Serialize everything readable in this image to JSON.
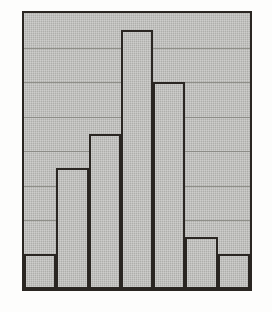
{
  "figure": {
    "title": "",
    "background_color": "#fdfdfc"
  },
  "plot": {
    "frame_color": "#2a2622",
    "fill_color": "#b5b5b2",
    "gridline_color": "#85857f",
    "gridline_count": 9
  },
  "chart_data": {
    "type": "bar",
    "title": "",
    "subtitle": "",
    "xlabel": "",
    "ylabel": "",
    "categories": [
      "1",
      "2",
      "3",
      "4",
      "5",
      "6",
      "7"
    ],
    "values": [
      1,
      3.5,
      4.5,
      7.5,
      6,
      1.5,
      1
    ],
    "series": [
      {
        "name": "Frequency",
        "values": [
          1,
          3.5,
          4.5,
          7.5,
          6,
          1.5,
          1
        ]
      }
    ],
    "ylim": [
      0,
      8
    ],
    "xlim": [
      0,
      7
    ],
    "yticks": [
      0,
      1,
      2,
      3,
      4,
      5,
      6,
      7,
      8
    ],
    "ytick_labels": [
      "",
      "",
      "",
      "",
      "",
      "",
      "",
      "",
      ""
    ],
    "xtick_labels": [
      "",
      "",
      "",
      "",
      "",
      "",
      ""
    ],
    "grid": true,
    "grid_axis": "y",
    "legend": false,
    "legend_position": "none",
    "bar_count": 7,
    "bar_fill": "#b5b5b2",
    "bar_edge": "#2a2622",
    "annotations": []
  }
}
